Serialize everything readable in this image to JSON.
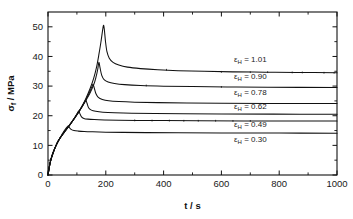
{
  "chart_data": {
    "type": "line",
    "title": "",
    "xlabel": "t / s",
    "ylabel": "σf / MPa",
    "ylabel_symbol": "σ",
    "ylabel_subscript": "f",
    "ylabel_unit": "/ MPa",
    "xlabel_symbol": "t",
    "xlabel_unit": "/ s",
    "xlim": [
      0,
      1000
    ],
    "ylim": [
      0,
      55
    ],
    "grid": false,
    "legend_position": "inline-right",
    "x_ticks": [
      0,
      200,
      400,
      600,
      800,
      1000
    ],
    "x_tick_labels": [
      "0",
      "200",
      "400",
      "600",
      "800",
      "1000"
    ],
    "x_minor_step": 100,
    "y_ticks": [
      0,
      10,
      20,
      30,
      40,
      50
    ],
    "y_tick_labels": [
      "0",
      "10",
      "20",
      "30",
      "40",
      "50"
    ],
    "y_minor_step": 5,
    "series": [
      {
        "name": "εH = 1.01",
        "label_symbol": "ε",
        "label_subscript": "H",
        "label_value": "= 1.01",
        "color": "#111111",
        "peak_t": 192,
        "peak_value": 50.5,
        "plateau_value": 34.5,
        "points": [
          [
            0,
            0
          ],
          [
            5,
            3.0
          ],
          [
            10,
            5.2
          ],
          [
            18,
            7.6
          ],
          [
            28,
            10.0
          ],
          [
            40,
            12.2
          ],
          [
            55,
            14.3
          ],
          [
            70,
            16.2
          ],
          [
            85,
            18.2
          ],
          [
            100,
            20.4
          ],
          [
            115,
            22.8
          ],
          [
            130,
            25.6
          ],
          [
            145,
            29.0
          ],
          [
            158,
            32.6
          ],
          [
            168,
            36.4
          ],
          [
            176,
            40.6
          ],
          [
            183,
            44.8
          ],
          [
            188,
            48.2
          ],
          [
            192,
            50.5
          ],
          [
            195,
            49.0
          ],
          [
            199,
            45.0
          ],
          [
            204,
            41.6
          ],
          [
            212,
            39.4
          ],
          [
            225,
            38.0
          ],
          [
            245,
            37.1
          ],
          [
            275,
            36.4
          ],
          [
            320,
            35.9
          ],
          [
            380,
            35.5
          ],
          [
            450,
            35.2
          ],
          [
            540,
            35.0
          ],
          [
            640,
            34.8
          ],
          [
            750,
            34.7
          ],
          [
            860,
            34.6
          ],
          [
            1000,
            34.5
          ]
        ]
      },
      {
        "name": "εH = 0.90",
        "label_symbol": "ε",
        "label_subscript": "H",
        "label_value": "= 0.90",
        "color": "#111111",
        "peak_t": 176,
        "peak_value": 38.0,
        "plateau_value": 29.5,
        "points": [
          [
            0,
            0
          ],
          [
            5,
            3.0
          ],
          [
            10,
            5.2
          ],
          [
            18,
            7.6
          ],
          [
            28,
            10.0
          ],
          [
            40,
            12.2
          ],
          [
            55,
            14.3
          ],
          [
            70,
            16.2
          ],
          [
            85,
            18.2
          ],
          [
            100,
            20.4
          ],
          [
            115,
            22.6
          ],
          [
            130,
            25.0
          ],
          [
            145,
            27.6
          ],
          [
            158,
            30.4
          ],
          [
            166,
            33.0
          ],
          [
            172,
            35.6
          ],
          [
            176,
            38.0
          ],
          [
            180,
            36.2
          ],
          [
            186,
            33.6
          ],
          [
            194,
            32.2
          ],
          [
            208,
            31.4
          ],
          [
            230,
            30.9
          ],
          [
            265,
            30.5
          ],
          [
            320,
            30.2
          ],
          [
            400,
            29.98
          ],
          [
            500,
            29.85
          ],
          [
            620,
            29.72
          ],
          [
            760,
            29.62
          ],
          [
            1000,
            29.5
          ]
        ]
      },
      {
        "name": "εH = 0.78",
        "label_symbol": "ε",
        "label_subscript": "H",
        "label_value": "= 0.78",
        "color": "#111111",
        "peak_t": 156,
        "peak_value": 30.6,
        "plateau_value": 24.1,
        "points": [
          [
            0,
            0
          ],
          [
            5,
            3.0
          ],
          [
            10,
            5.2
          ],
          [
            18,
            7.6
          ],
          [
            28,
            10.0
          ],
          [
            40,
            12.2
          ],
          [
            55,
            14.3
          ],
          [
            70,
            16.2
          ],
          [
            85,
            18.2
          ],
          [
            100,
            20.4
          ],
          [
            112,
            22.2
          ],
          [
            124,
            24.2
          ],
          [
            136,
            26.4
          ],
          [
            146,
            28.4
          ],
          [
            152,
            29.8
          ],
          [
            156,
            30.6
          ],
          [
            160,
            29.4
          ],
          [
            166,
            27.4
          ],
          [
            174,
            26.2
          ],
          [
            188,
            25.5
          ],
          [
            210,
            25.05
          ],
          [
            245,
            24.78
          ],
          [
            300,
            24.58
          ],
          [
            380,
            24.42
          ],
          [
            480,
            24.32
          ],
          [
            600,
            24.24
          ],
          [
            760,
            24.16
          ],
          [
            1000,
            24.1
          ]
        ]
      },
      {
        "name": "εH = 0.62",
        "label_symbol": "ε",
        "label_subscript": "H",
        "label_value": "= 0.62",
        "color": "#111111",
        "peak_t": 131,
        "peak_value": 25.2,
        "plateau_value": 20.5,
        "points": [
          [
            0,
            0
          ],
          [
            5,
            3.0
          ],
          [
            10,
            5.2
          ],
          [
            18,
            7.6
          ],
          [
            28,
            10.0
          ],
          [
            40,
            12.2
          ],
          [
            55,
            14.3
          ],
          [
            70,
            16.2
          ],
          [
            85,
            18.2
          ],
          [
            98,
            20.0
          ],
          [
            110,
            21.8
          ],
          [
            120,
            23.4
          ],
          [
            127,
            24.6
          ],
          [
            131,
            25.2
          ],
          [
            135,
            24.2
          ],
          [
            141,
            22.6
          ],
          [
            150,
            21.9
          ],
          [
            165,
            21.5
          ],
          [
            190,
            21.2
          ],
          [
            230,
            21.0
          ],
          [
            290,
            20.86
          ],
          [
            370,
            20.76
          ],
          [
            470,
            20.68
          ],
          [
            600,
            20.6
          ],
          [
            780,
            20.55
          ],
          [
            1000,
            20.5
          ]
        ]
      },
      {
        "name": "εH = 0.49",
        "label_symbol": "ε",
        "label_subscript": "H",
        "label_value": "= 0.49",
        "color": "#111111",
        "peak_t": 106,
        "peak_value": 21.6,
        "plateau_value": 18.2,
        "points": [
          [
            0,
            0
          ],
          [
            5,
            3.0
          ],
          [
            10,
            5.2
          ],
          [
            18,
            7.6
          ],
          [
            28,
            10.0
          ],
          [
            40,
            12.2
          ],
          [
            55,
            14.3
          ],
          [
            68,
            16.0
          ],
          [
            80,
            17.6
          ],
          [
            92,
            19.3
          ],
          [
            100,
            20.6
          ],
          [
            106,
            21.6
          ],
          [
            110,
            20.8
          ],
          [
            116,
            19.6
          ],
          [
            124,
            19.1
          ],
          [
            138,
            18.85
          ],
          [
            160,
            18.7
          ],
          [
            195,
            18.58
          ],
          [
            245,
            18.48
          ],
          [
            310,
            18.42
          ],
          [
            400,
            18.36
          ],
          [
            520,
            18.3
          ],
          [
            680,
            18.25
          ],
          [
            860,
            18.22
          ],
          [
            1000,
            18.2
          ]
        ]
      },
      {
        "name": "εH = 0.30",
        "label_symbol": "ε",
        "label_subscript": "H",
        "label_value": "= 0.30",
        "color": "#111111",
        "peak_t": 70,
        "peak_value": 16.5,
        "plateau_value": 14.1,
        "points": [
          [
            0,
            0
          ],
          [
            5,
            3.0
          ],
          [
            10,
            5.2
          ],
          [
            18,
            7.6
          ],
          [
            28,
            10.0
          ],
          [
            38,
            11.9
          ],
          [
            48,
            13.6
          ],
          [
            58,
            15.2
          ],
          [
            65,
            16.1
          ],
          [
            70,
            16.5
          ],
          [
            74,
            16.0
          ],
          [
            80,
            15.4
          ],
          [
            90,
            15.0
          ],
          [
            105,
            14.8
          ],
          [
            125,
            14.66
          ],
          [
            155,
            14.56
          ],
          [
            200,
            14.46
          ],
          [
            260,
            14.38
          ],
          [
            340,
            14.3
          ],
          [
            450,
            14.24
          ],
          [
            600,
            14.18
          ],
          [
            800,
            14.14
          ],
          [
            1000,
            14.1
          ]
        ]
      }
    ],
    "annotations": [
      {
        "text": "εH = 1.01",
        "x": 700,
        "y": 38.2
      },
      {
        "text": "εH = 0.90",
        "x": 700,
        "y": 32.4
      },
      {
        "text": "εH = 0.78",
        "x": 700,
        "y": 26.9
      },
      {
        "text": "εH = 0.62",
        "x": 700,
        "y": 22.3
      },
      {
        "text": "εH = 0.49",
        "x": 700,
        "y": 16.3
      },
      {
        "text": "εH = 0.30",
        "x": 700,
        "y": 11.1
      }
    ]
  }
}
